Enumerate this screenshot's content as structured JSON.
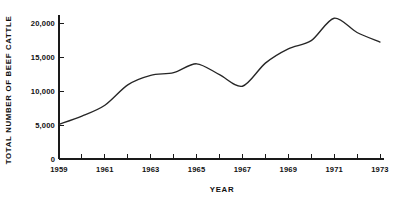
{
  "chart_data": {
    "type": "line",
    "title": "",
    "xlabel": "YEAR",
    "ylabel": "TOTAL NUMBER OF BEEF CATTLE",
    "x": [
      1959,
      1960,
      1961,
      1962,
      1963,
      1964,
      1965,
      1966,
      1967,
      1968,
      1969,
      1970,
      1971,
      1972,
      1973
    ],
    "values": [
      5100,
      6300,
      7900,
      10900,
      12300,
      12700,
      14000,
      12400,
      10700,
      14100,
      16200,
      17400,
      20700,
      18600,
      17200
    ],
    "xlim": [
      1959,
      1973
    ],
    "ylim": [
      0,
      21500
    ],
    "x_ticks": [
      1959,
      1960,
      1961,
      1962,
      1963,
      1964,
      1965,
      1966,
      1967,
      1968,
      1969,
      1970,
      1971,
      1972,
      1973
    ],
    "x_tick_labels": [
      "1959",
      "",
      "1961",
      "",
      "1963",
      "",
      "1965",
      "",
      "1967",
      "",
      "1969",
      "",
      "1971",
      "",
      "1973"
    ],
    "y_ticks": [
      0,
      5000,
      10000,
      15000,
      20000
    ],
    "y_tick_labels": [
      "0",
      "5,000",
      "10,000",
      "15,000",
      "20,000"
    ],
    "grid": false,
    "legend": false,
    "line_color": "#262626",
    "axis_color": "#1a1a1a",
    "background_color": "#ffffff"
  },
  "axes": {
    "y_title": "TOTAL NUMBER OF BEEF CATTLE",
    "x_title": "YEAR"
  }
}
